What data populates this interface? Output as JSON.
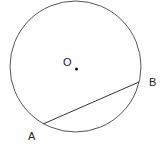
{
  "diagram": {
    "type": "geometry-circle-chord",
    "circle": {
      "cx": 75.5,
      "cy": 66.5,
      "r": 65.5,
      "stroke": "#555555"
    },
    "center_point": {
      "x": 76.5,
      "y": 69,
      "label": "O"
    },
    "chord": {
      "from": "A",
      "to": "B"
    },
    "points": [
      {
        "label": "A",
        "x": 43,
        "y": 124
      },
      {
        "label": "B",
        "x": 139,
        "y": 82
      }
    ]
  }
}
